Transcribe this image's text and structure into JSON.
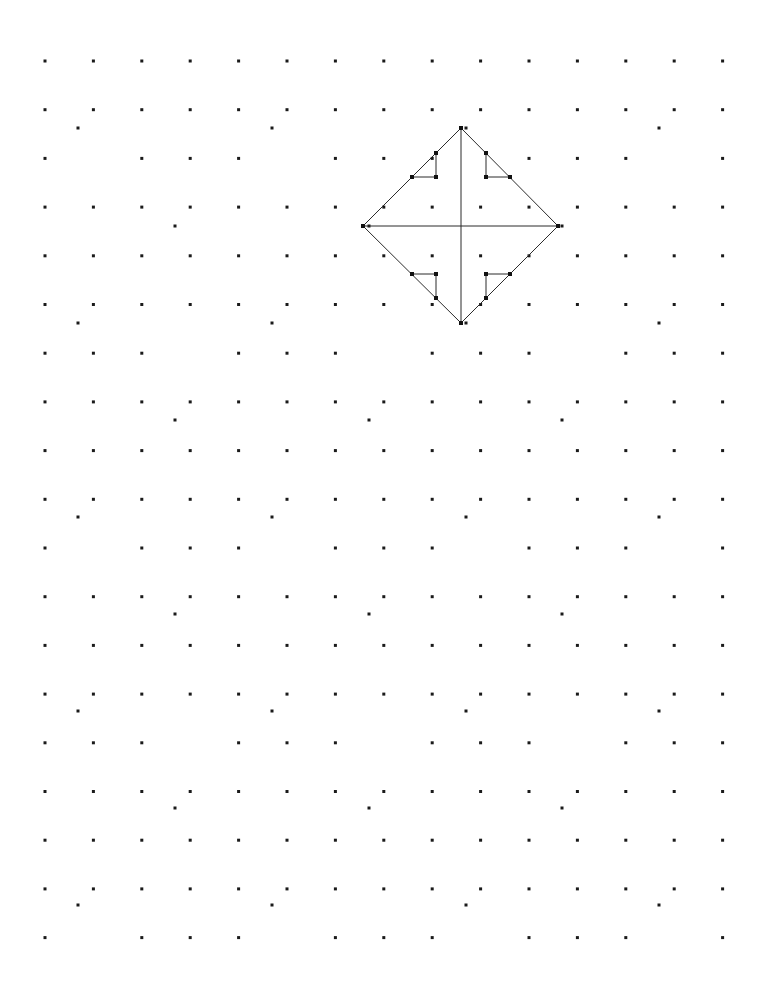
{
  "page": {
    "width": 769,
    "height": 981,
    "background_color": "#ffffff",
    "paper_type": "dotty-grid-paper"
  },
  "grid": {
    "description": "Regular array of small square dots (dotty / geoboard paper)",
    "dot_color": "#1a1a1a",
    "dot_size_px": 3,
    "origin_x": 45,
    "origin_y": 61,
    "spacing_x": 48.4,
    "spacing_y": 48.7,
    "columns": 15,
    "rows": 19,
    "missing_dots": [
      {
        "col": 1,
        "row": 2
      },
      {
        "col": 5,
        "row": 2
      },
      {
        "col": 9,
        "row": 2
      },
      {
        "col": 13,
        "row": 2
      },
      {
        "col": 3,
        "row": 6
      },
      {
        "col": 7,
        "row": 6
      },
      {
        "col": 11,
        "row": 6
      },
      {
        "col": 1,
        "row": 10
      },
      {
        "col": 5,
        "row": 10
      },
      {
        "col": 9,
        "row": 10
      },
      {
        "col": 13,
        "row": 10
      },
      {
        "col": 3,
        "row": 14
      },
      {
        "col": 7,
        "row": 14
      },
      {
        "col": 11,
        "row": 14
      },
      {
        "col": 1,
        "row": 18
      },
      {
        "col": 5,
        "row": 18
      },
      {
        "col": 9,
        "row": 18
      },
      {
        "col": 13,
        "row": 18
      }
    ],
    "offset_dots": [
      {
        "x": 78,
        "y": 128
      },
      {
        "x": 272,
        "y": 128
      },
      {
        "x": 466,
        "y": 128
      },
      {
        "x": 659,
        "y": 128
      },
      {
        "x": 175,
        "y": 226
      },
      {
        "x": 369,
        "y": 226
      },
      {
        "x": 562,
        "y": 226
      },
      {
        "x": 78,
        "y": 323
      },
      {
        "x": 272,
        "y": 323
      },
      {
        "x": 466,
        "y": 323
      },
      {
        "x": 659,
        "y": 323
      },
      {
        "x": 175,
        "y": 420
      },
      {
        "x": 369,
        "y": 420
      },
      {
        "x": 562,
        "y": 420
      },
      {
        "x": 78,
        "y": 517
      },
      {
        "x": 272,
        "y": 517
      },
      {
        "x": 466,
        "y": 517
      },
      {
        "x": 659,
        "y": 517
      },
      {
        "x": 175,
        "y": 614
      },
      {
        "x": 369,
        "y": 614
      },
      {
        "x": 562,
        "y": 614
      },
      {
        "x": 78,
        "y": 711
      },
      {
        "x": 272,
        "y": 711
      },
      {
        "x": 466,
        "y": 711
      },
      {
        "x": 659,
        "y": 711
      },
      {
        "x": 175,
        "y": 808
      },
      {
        "x": 369,
        "y": 808
      },
      {
        "x": 562,
        "y": 808
      },
      {
        "x": 78,
        "y": 905
      },
      {
        "x": 272,
        "y": 905
      },
      {
        "x": 466,
        "y": 905
      },
      {
        "x": 659,
        "y": 905
      }
    ]
  },
  "figure": {
    "name": "pinwheel-diamond",
    "stroke_color": "#2b2b2b",
    "stroke_width": 1,
    "vertex_color": "#111111",
    "vertex_size_px": 4,
    "diamond": {
      "label": "outer-diamond",
      "points": "461,128 558,226 461,323 363,226",
      "top": {
        "x": 461,
        "y": 128
      },
      "right": {
        "x": 558,
        "y": 226
      },
      "bottom": {
        "x": 461,
        "y": 323
      },
      "left": {
        "x": 363,
        "y": 226
      }
    },
    "axes": {
      "vertical": {
        "x1": 461,
        "y1": 128,
        "x2": 461,
        "y2": 323
      },
      "horizontal": {
        "x1": 363,
        "y1": 226,
        "x2": 558,
        "y2": 226
      }
    },
    "hooks": [
      {
        "label": "hook-top-left",
        "quadrant": "NW",
        "path": "M 412,177 L 436,177 L 436,153"
      },
      {
        "label": "hook-top-right",
        "quadrant": "NE",
        "path": "M 486,153 L 486,177 L 510,177"
      },
      {
        "label": "hook-bottom-right",
        "quadrant": "SE",
        "path": "M 510,274 L 486,274 L 486,298"
      },
      {
        "label": "hook-bottom-left",
        "quadrant": "SW",
        "path": "M 436,298 L 436,274 L 412,274"
      }
    ],
    "nodes": [
      {
        "x": 461,
        "y": 128
      },
      {
        "x": 558,
        "y": 226
      },
      {
        "x": 461,
        "y": 323
      },
      {
        "x": 363,
        "y": 226
      },
      {
        "x": 436,
        "y": 153
      },
      {
        "x": 412,
        "y": 177
      },
      {
        "x": 436,
        "y": 177
      },
      {
        "x": 486,
        "y": 153
      },
      {
        "x": 486,
        "y": 177
      },
      {
        "x": 510,
        "y": 177
      },
      {
        "x": 412,
        "y": 274
      },
      {
        "x": 436,
        "y": 274
      },
      {
        "x": 436,
        "y": 298
      },
      {
        "x": 486,
        "y": 274
      },
      {
        "x": 510,
        "y": 274
      },
      {
        "x": 486,
        "y": 298
      }
    ]
  }
}
